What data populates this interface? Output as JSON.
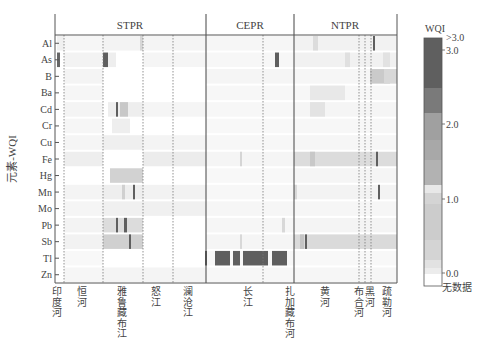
{
  "chart_data": {
    "type": "heatmap",
    "title": "",
    "ylabel": "元素-WQI",
    "xlabel": "",
    "rows": [
      "Al",
      "As",
      "B",
      "Ba",
      "Cd",
      "Cr",
      "Cu",
      "Fe",
      "Hg",
      "Mn",
      "Mo",
      "Pb",
      "Sb",
      "Tl",
      "Zn"
    ],
    "regions": [
      {
        "name": "STPR",
        "x0": 55,
        "x1": 206
      },
      {
        "name": "CEPR",
        "x0": 206,
        "x1": 294
      },
      {
        "name": "NTPR",
        "x0": 294,
        "x1": 397
      }
    ],
    "rivers": [
      {
        "name": "印度河",
        "label_x": 57,
        "chars": [
          "印",
          "度",
          "河"
        ]
      },
      {
        "name": "恒河",
        "label_x": 82,
        "chars": [
          "恒",
          "河"
        ]
      },
      {
        "name": "雅鲁藏布江",
        "label_x": 122,
        "chars": [
          "雅",
          "鲁",
          "藏",
          "布",
          "江"
        ]
      },
      {
        "name": "怒江",
        "label_x": 156,
        "chars": [
          "怒",
          "江"
        ]
      },
      {
        "name": "澜沧江",
        "label_x": 188,
        "chars": [
          "澜",
          "沧",
          "江"
        ]
      },
      {
        "name": "长江",
        "label_x": 248,
        "chars": [
          "长",
          "江"
        ]
      },
      {
        "name": "扎加藏布河",
        "label_x": 290,
        "chars": [
          "扎",
          "加",
          "藏",
          "布",
          "河"
        ]
      },
      {
        "name": "黄河",
        "label_x": 325,
        "chars": [
          "黄",
          "河"
        ]
      },
      {
        "name": "布合河",
        "label_x": 359,
        "chars": [
          "布",
          "合",
          "河"
        ]
      },
      {
        "name": "黑河",
        "label_x": 370,
        "chars": [
          "黑",
          "河"
        ]
      },
      {
        "name": "疏勒河",
        "label_x": 387,
        "chars": [
          "疏",
          "勒",
          "河"
        ]
      }
    ],
    "separators": {
      "solid": [
        206,
        294
      ],
      "dotted": [
        64,
        103,
        143,
        173,
        263,
        359,
        365,
        371
      ]
    },
    "colorbar": {
      "title": "WQI",
      "ticks": [
        ">3.0",
        "3.0",
        "2.0",
        "1.0",
        "0.0",
        "无数据"
      ],
      "range": [
        0,
        3
      ],
      "bins": [
        {
          "from": 3.0,
          "to": 3.5,
          "color": "#5f5f5f"
        },
        {
          "from": 2.5,
          "to": 3.0,
          "color": "#666666"
        },
        {
          "from": 2.0,
          "to": 2.5,
          "color": "#8a8a8a"
        },
        {
          "from": 1.8,
          "to": 2.0,
          "color": "#a8a8a8"
        },
        {
          "from": 1.5,
          "to": 1.8,
          "color": "#b2b2b2"
        },
        {
          "from": 1.2,
          "to": 1.5,
          "color": "#bcbcbc"
        },
        {
          "from": 1.0,
          "to": 1.2,
          "color": "#e6e6e6"
        },
        {
          "from": 0.8,
          "to": 1.0,
          "color": "#cfcfcf"
        },
        {
          "from": 0.5,
          "to": 0.8,
          "color": "#d6d6d6"
        },
        {
          "from": 0.2,
          "to": 0.5,
          "color": "#dddddd"
        },
        {
          "from": 0.1,
          "to": 0.2,
          "color": "#e6e6e6"
        },
        {
          "from": 0.0,
          "to": 0.1,
          "color": "#efefef"
        },
        {
          "from": null,
          "to": null,
          "color": "#ffffff",
          "label": "无数据"
        }
      ]
    },
    "notable_cells": [
      {
        "row": "As",
        "x": [
          57,
          60
        ],
        "wqi": 2.5
      },
      {
        "row": "As",
        "x": [
          103,
          108
        ],
        "wqi": 3.0
      },
      {
        "row": "As",
        "x": [
          275,
          279
        ],
        "wqi": 3.0
      },
      {
        "row": "Al",
        "x": [
          373,
          375
        ],
        "wqi": 3.0
      },
      {
        "row": "Cd",
        "x": [
          116,
          118
        ],
        "wqi": 3.0
      },
      {
        "row": "Fe",
        "x": [
          376,
          378
        ],
        "wqi": 3.0
      },
      {
        "row": "Mn",
        "x": [
          133,
          135
        ],
        "wqi": 3.0
      },
      {
        "row": "Mn",
        "x": [
          378,
          380
        ],
        "wqi": 3.0
      },
      {
        "row": "Pb",
        "x": [
          116,
          118
        ],
        "wqi": 3.0
      },
      {
        "row": "Pb",
        "x": [
          124,
          127
        ],
        "wqi": 3.0
      },
      {
        "row": "Sb",
        "x": [
          129,
          131
        ],
        "wqi": 3.0
      },
      {
        "row": "Sb",
        "x": [
          305,
          307
        ],
        "wqi": 3.0
      },
      {
        "row": "Tl",
        "x": [
          205,
          207
        ],
        "wqi": 3.0
      },
      {
        "row": "Tl",
        "x": [
          215,
          230
        ],
        "wqi": 3.0
      },
      {
        "row": "Tl",
        "x": [
          233,
          240
        ],
        "wqi": 3.0
      },
      {
        "row": "Tl",
        "x": [
          243,
          268
        ],
        "wqi": 3.0
      },
      {
        "row": "Tl",
        "x": [
          272,
          287
        ],
        "wqi": 3.0
      }
    ]
  },
  "labels": {
    "ylabel": "元素-WQI",
    "colorbar_title": "WQI",
    "region_stpr": "STPR",
    "region_cepr": "CEPR",
    "region_ntpr": "NTPR"
  }
}
